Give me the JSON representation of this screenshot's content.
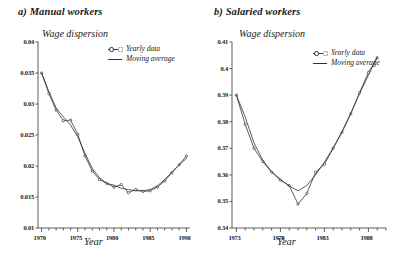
{
  "figure": {
    "background": "#ffffff",
    "line_color": "#333333",
    "axis_color": "#4a4a4a"
  },
  "panels": [
    {
      "id": "manual",
      "title": "a) Manual workers",
      "ylabel": "Wage dispersion",
      "xlabel": "Year",
      "legend": [
        {
          "label": "Yearly data",
          "style": "line-with-markers"
        },
        {
          "label": "Moving average",
          "style": "line"
        }
      ],
      "ytick_labels": [
        "0.04",
        "0.035",
        "0.03",
        "0.025",
        "0.02",
        "0.015",
        "0.01"
      ],
      "xtick_labels": [
        "1970",
        "1975",
        "1980",
        "1985",
        "1990"
      ]
    },
    {
      "id": "salaried",
      "title": "b) Salaried workers",
      "ylabel": "Wage dispersion",
      "xlabel": "Year",
      "legend": [
        {
          "label": "Yearly data",
          "style": "line-with-markers"
        },
        {
          "label": "Moving average",
          "style": "line"
        }
      ],
      "ytick_labels": [
        "0.41",
        "0.4",
        "0.39",
        "0.38",
        "0.37",
        "0.36",
        "0.35",
        "0.34"
      ],
      "xtick_labels": [
        "1973",
        "1978",
        "1983",
        "1988"
      ]
    }
  ],
  "chart_data": [
    {
      "type": "line",
      "id": "manual",
      "title": "a) Manual workers",
      "xlabel": "Year",
      "ylabel": "Wage dispersion",
      "xlim": [
        1969.5,
        1990.5
      ],
      "ylim": [
        0.01,
        0.04
      ],
      "yticks": [
        0.01,
        0.015,
        0.02,
        0.025,
        0.03,
        0.035,
        0.04
      ],
      "xticks": [
        1970,
        1975,
        1980,
        1985,
        1990
      ],
      "grid": false,
      "legend_position": "top-right",
      "x": [
        1970,
        1971,
        1972,
        1973,
        1974,
        1975,
        1976,
        1977,
        1978,
        1979,
        1980,
        1981,
        1982,
        1983,
        1984,
        1985,
        1986,
        1987,
        1988,
        1989,
        1990
      ],
      "series": [
        {
          "name": "Yearly data",
          "markers": true,
          "values": [
            0.035,
            0.0317,
            0.029,
            0.0273,
            0.0274,
            0.0251,
            0.0216,
            0.0192,
            0.0178,
            0.0172,
            0.0166,
            0.017,
            0.0157,
            0.0162,
            0.0159,
            0.016,
            0.0166,
            0.0176,
            0.0189,
            0.0202,
            0.0216
          ]
        },
        {
          "name": "Moving average",
          "markers": false,
          "values": [
            0.035,
            0.032,
            0.0294,
            0.0279,
            0.0266,
            0.0247,
            0.022,
            0.0196,
            0.0181,
            0.0172,
            0.0169,
            0.0164,
            0.0162,
            0.016,
            0.016,
            0.0162,
            0.0168,
            0.0178,
            0.019,
            0.0202,
            0.0212
          ]
        }
      ]
    },
    {
      "type": "line",
      "id": "salaried",
      "title": "b) Salaried workers",
      "xlabel": "Year",
      "ylabel": "Wage dispersion",
      "xlim": [
        1972.5,
        1990.0
      ],
      "ylim": [
        0.34,
        0.41
      ],
      "yticks": [
        0.34,
        0.35,
        0.36,
        0.37,
        0.38,
        0.39,
        0.4,
        0.41
      ],
      "xticks": [
        1973,
        1978,
        1983,
        1988
      ],
      "grid": false,
      "legend_position": "top-right",
      "x": [
        1973,
        1974,
        1975,
        1976,
        1977,
        1978,
        1979,
        1980,
        1981,
        1982,
        1983,
        1984,
        1985,
        1986,
        1987,
        1988,
        1989
      ],
      "series": [
        {
          "name": "Yearly data",
          "markers": true,
          "values": [
            0.39,
            0.379,
            0.37,
            0.365,
            0.361,
            0.358,
            0.356,
            0.349,
            0.353,
            0.361,
            0.364,
            0.37,
            0.376,
            0.383,
            0.391,
            0.3985,
            0.404
          ]
        },
        {
          "name": "Moving average",
          "markers": false,
          "values": [
            0.39,
            0.3818,
            0.372,
            0.3655,
            0.3612,
            0.3583,
            0.3558,
            0.354,
            0.356,
            0.36,
            0.3648,
            0.3702,
            0.3763,
            0.3832,
            0.3906,
            0.3975,
            0.4045
          ]
        }
      ]
    }
  ]
}
